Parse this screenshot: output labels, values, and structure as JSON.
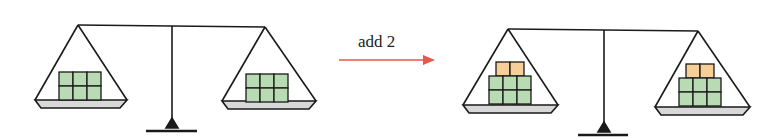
{
  "diagram": {
    "arrow": {
      "label": "add 2",
      "color": "#e8574a"
    },
    "colors": {
      "line": "#1a1a1a",
      "pan_fill": "#d8d8d8",
      "green_block": "#b9dbb3",
      "orange_block": "#f5cf97"
    },
    "before": {
      "left_pan": {
        "green_blocks": 6,
        "orange_blocks": 0
      },
      "right_pan": {
        "green_blocks": 6,
        "orange_blocks": 0
      }
    },
    "after": {
      "left_pan": {
        "green_blocks": 6,
        "orange_blocks": 2
      },
      "right_pan": {
        "green_blocks": 6,
        "orange_blocks": 2
      }
    }
  }
}
